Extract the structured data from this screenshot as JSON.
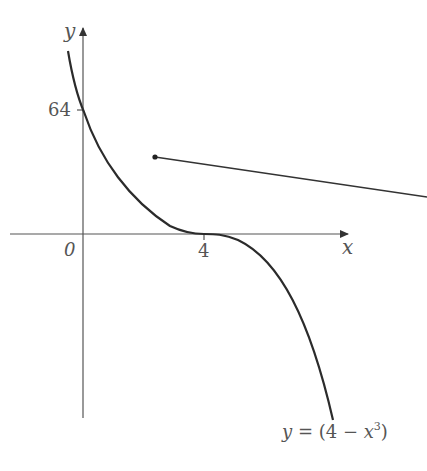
{
  "diagram": {
    "y_axis_label": "y",
    "x_axis_label": "x",
    "origin_label": "0",
    "y_intercept_label": "64",
    "x_intercept_label": "4",
    "curve_label": {
      "lhs": "y",
      "eq": " = (4 − ",
      "var": "x",
      "exp": "3",
      "close": ")"
    },
    "curve_color": "#2b2b2b",
    "axis_color": "#555555"
  }
}
